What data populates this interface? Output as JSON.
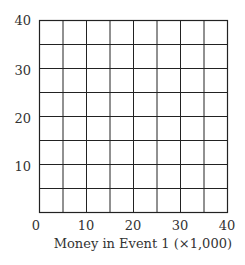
{
  "chart_data": {
    "type": "scatter",
    "title": "",
    "xlabel": "Money in Event 1 (×1,000)",
    "ylabel": "",
    "xlim": [
      0,
      40
    ],
    "ylim": [
      0,
      40
    ],
    "x_ticks": [
      "0",
      "10",
      "20",
      "30",
      "40"
    ],
    "y_ticks": [
      "10",
      "20",
      "30",
      "40"
    ],
    "grid": true,
    "grid_step": 5,
    "series": [],
    "legend": null
  }
}
